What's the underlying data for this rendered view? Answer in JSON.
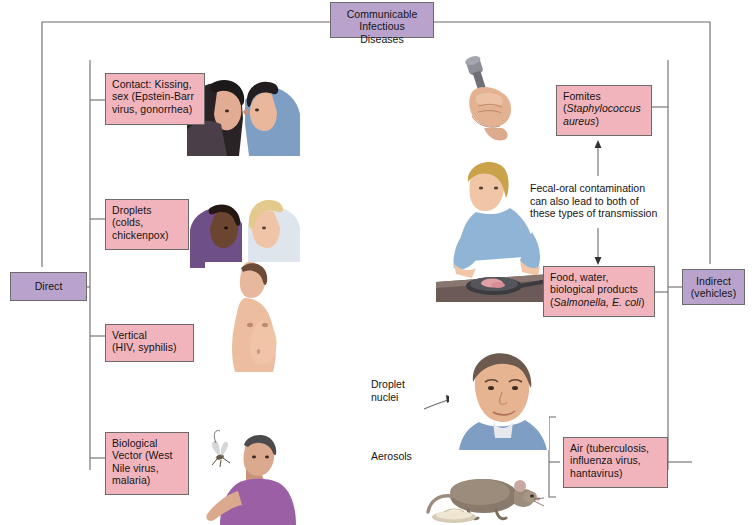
{
  "diagram": {
    "title": "Communicable Infectious Diseases",
    "colors": {
      "box_fill_pink": "#f2b4bc",
      "box_fill_purple": "#b9a3cd",
      "box_border": "#6b6b6b",
      "connector": "#6b6b6b",
      "text": "#141414"
    }
  },
  "header": {
    "line1": "Communicable",
    "line2": "Infectious Diseases"
  },
  "branches": {
    "direct": "Direct",
    "indirect_line1": "Indirect",
    "indirect_line2": "(vehicles)"
  },
  "direct_modes": [
    {
      "id": "contact",
      "line1": "Contact: Kissing,",
      "line2": "sex (Epstein-Barr",
      "line3": "virus, gonorrhea)"
    },
    {
      "id": "droplets",
      "line1": "Droplets",
      "line2": "(colds,",
      "line3": "chickenpox)"
    },
    {
      "id": "vertical",
      "line1": "Vertical",
      "line2": "(HIV, syphilis)"
    },
    {
      "id": "biological-vector",
      "line1": "Biological",
      "line2": "Vector (West",
      "line3": "Nile virus,",
      "line4": "malaria)"
    }
  ],
  "indirect_modes": [
    {
      "id": "fomites",
      "line1": "Fomites",
      "line2_prefix": "(",
      "line2_italic": "Staphylococcus",
      "line3_italic": "aureus",
      "line3_suffix": ")"
    },
    {
      "id": "food-water",
      "line1": "Food, water,",
      "line2": "biological products",
      "line3_prefix": "(",
      "line3_italic": "Salmonella, E. coli",
      "line3_suffix": ")"
    },
    {
      "id": "air",
      "line1": "Air (tuberculosis,",
      "line2": "influenza virus,",
      "line3": "hantavirus)"
    }
  ],
  "annotations": {
    "fecal_oral_line1": "Fecal-oral contamination",
    "fecal_oral_line2": "can also lead to both of",
    "fecal_oral_line3": "these types of transmission",
    "droplet_nuclei_line1": "Droplet",
    "droplet_nuclei_line2": "nuclei",
    "aerosols": "Aerosols"
  },
  "illustrations": [
    {
      "id": "kissing-couple",
      "alt": "Two people kissing"
    },
    {
      "id": "two-people-talking",
      "alt": "Two people facing each other talking"
    },
    {
      "id": "pregnant-woman",
      "alt": "Pregnant woman in profile"
    },
    {
      "id": "man-with-mosquito",
      "alt": "Man swatting a mosquito"
    },
    {
      "id": "hand-with-dumbbell",
      "alt": "Hand gripping a dumbbell"
    },
    {
      "id": "woman-preparing-food",
      "alt": "Woman preparing raw meat in a pan"
    },
    {
      "id": "man-face",
      "alt": "Face of a man inhaling droplet nuclei"
    },
    {
      "id": "rodent",
      "alt": "Rodent near a dish"
    }
  ]
}
